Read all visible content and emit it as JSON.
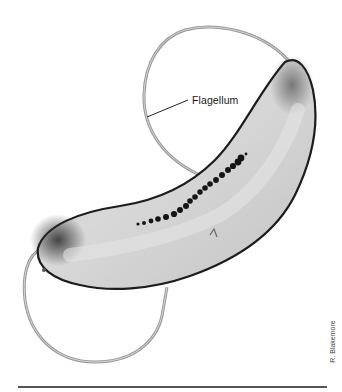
{
  "figure": {
    "label": "Flagellum",
    "credit": "R. Blakemore",
    "colors": {
      "background": "#ffffff",
      "cell_fill": "#cfcfcf",
      "cell_edge": "#1c1c1c",
      "flagellum": "#9a9a9a",
      "magnetosome": "#151515",
      "leader_line": "#222222",
      "rule": "#555555"
    }
  }
}
